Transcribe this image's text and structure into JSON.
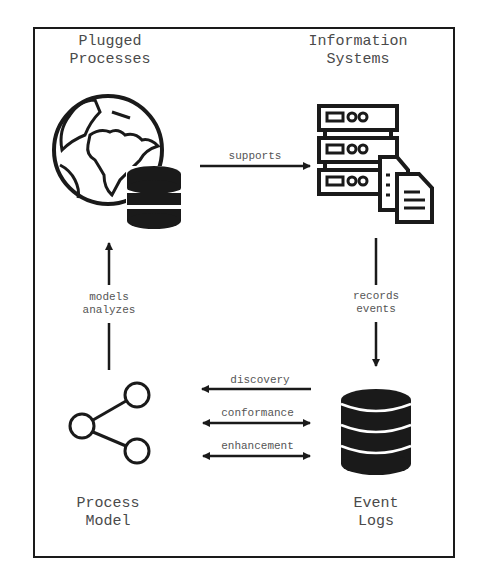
{
  "nodes": {
    "plugged_processes": {
      "title": "Plugged\nProcesses",
      "icon": "globe-database-icon"
    },
    "information_systems": {
      "title": "Information\nSystems",
      "icon": "server-documents-icon"
    },
    "process_model": {
      "title": "Process\nModel",
      "icon": "share-graph-icon"
    },
    "event_logs": {
      "title": "Event\nLogs",
      "icon": "database-icon"
    }
  },
  "edges": {
    "supports": "supports",
    "records_events": "records\nevents",
    "models_analyzes": "models\nanalyzes",
    "discovery": "discovery",
    "conformance": "conformance",
    "enhancement": "enhancement"
  },
  "colors": {
    "stroke": "#1a1a1a",
    "text": "#555555"
  }
}
